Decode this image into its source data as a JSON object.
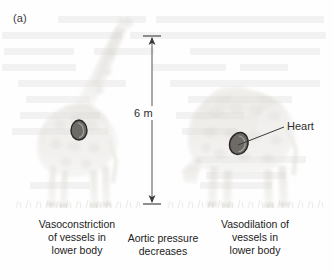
{
  "figure": {
    "panel_label": "(a)",
    "background_color": "#fefefe",
    "ink_color": "#2e2e2e"
  },
  "annotations": {
    "height_dimension": {
      "label": "6 m",
      "value": 6,
      "unit": "m",
      "description": "vertical distance between head height and ground"
    },
    "heart_callout": {
      "label": "Heart",
      "target": "right-giraffe-heart"
    }
  },
  "subjects": [
    {
      "name": "giraffe-left",
      "posture": "head raised upright",
      "heart_marker": true
    },
    {
      "name": "giraffe-right",
      "posture": "head lowered to ground",
      "heart_marker": true
    }
  ],
  "caption_flow": {
    "left": {
      "lines": [
        "Vasoconstriction",
        "of vessels in",
        "lower body"
      ]
    },
    "middle": {
      "lines": [
        "Aortic pressure",
        "decreases"
      ]
    },
    "right": {
      "lines": [
        "Vasodilation of",
        "vessels in",
        "lower body"
      ]
    },
    "arrow_direction": "left-to-right"
  },
  "icons": {
    "flow_arrow": "arrow-right-icon",
    "dimension_arrow": "double-headed-vertical-arrow-icon",
    "heart_leader": "leader-line-icon"
  }
}
